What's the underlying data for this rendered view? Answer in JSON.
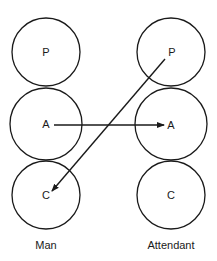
{
  "diagram": {
    "type": "transactional-analysis-ego-states",
    "columns": [
      {
        "caption": "Man",
        "states": [
          {
            "label": "P"
          },
          {
            "label": "A"
          },
          {
            "label": "C"
          }
        ]
      },
      {
        "caption": "Attendant",
        "states": [
          {
            "label": "P"
          },
          {
            "label": "A"
          },
          {
            "label": "C"
          }
        ]
      }
    ],
    "transactions": [
      {
        "from": "Man.A",
        "to": "Attendant.A"
      },
      {
        "from": "Attendant.P",
        "to": "Man.C"
      }
    ],
    "colors": {
      "stroke": "#1a1a1a",
      "background": "#ffffff"
    }
  }
}
